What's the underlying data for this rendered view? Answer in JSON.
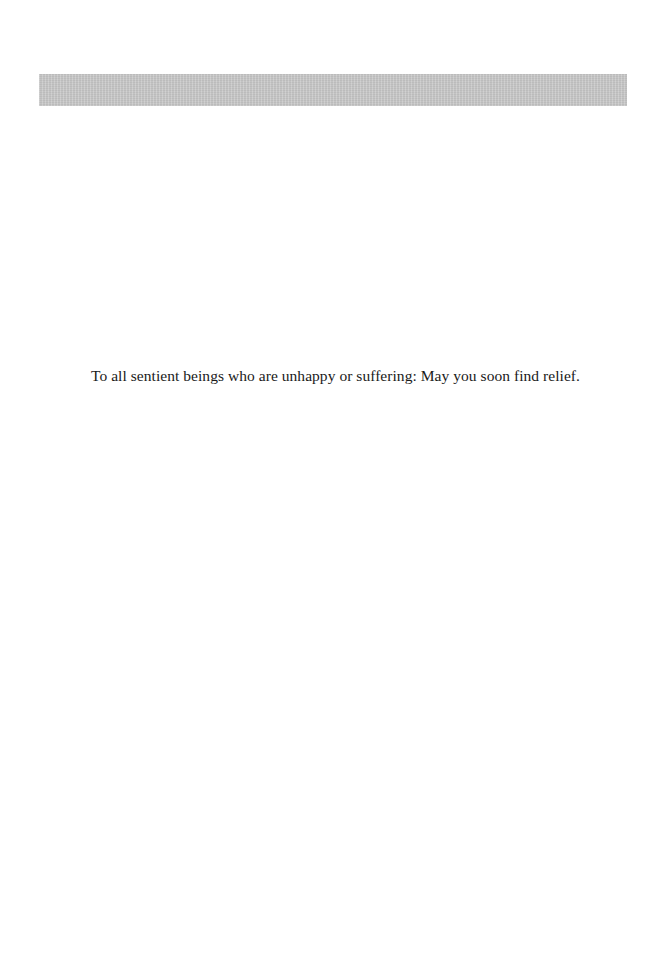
{
  "page": {
    "header_bar_color": "#c9c9c9",
    "dedication": "To all sentient beings who are unhappy or suffering: May you soon find relief."
  }
}
